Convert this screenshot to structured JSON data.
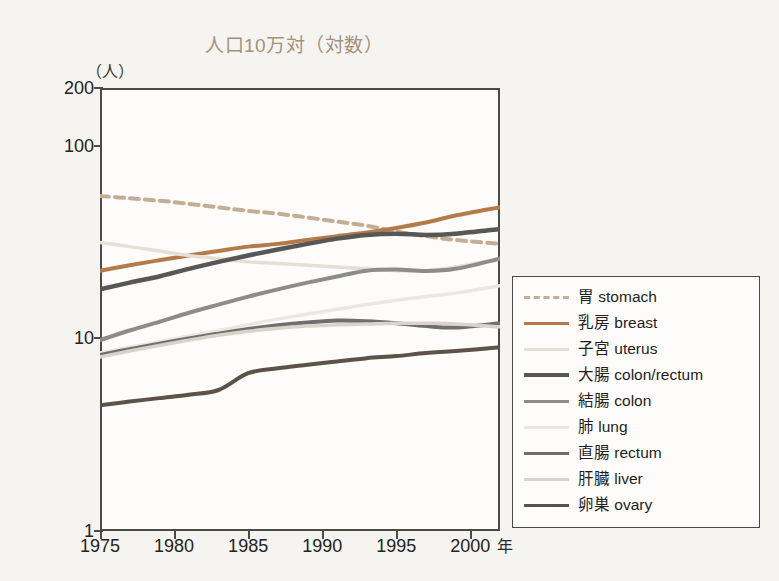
{
  "chart_data": {
    "type": "line",
    "title": "人口10万対（対数）",
    "ylabel": "（人）",
    "xlabel": "年",
    "yscale": "log",
    "ylim": [
      1,
      200
    ],
    "xlim": [
      1975,
      2002
    ],
    "yticks": [
      "200",
      "100",
      "10",
      "1"
    ],
    "ytick_values": [
      200,
      100,
      10,
      1
    ],
    "xticks": [
      "1975",
      "1980",
      "1985",
      "1990",
      "1995",
      "2000"
    ],
    "xtick_values": [
      1975,
      1980,
      1985,
      1990,
      1995,
      2000
    ],
    "grid": false,
    "legend_position": "right",
    "x": [
      1975,
      1977,
      1979,
      1981,
      1983,
      1985,
      1987,
      1989,
      1991,
      1993,
      1995,
      1997,
      1999,
      2002
    ],
    "series": [
      {
        "name": "胃 stomach",
        "color": "#c3ae93",
        "style": "dashed",
        "width": 4.0,
        "values": [
          55.0,
          53.5,
          52.0,
          50.0,
          48.0,
          46.0,
          44.5,
          42.5,
          40.5,
          38.5,
          36.0,
          34.0,
          32.5,
          31.0
        ]
      },
      {
        "name": "乳房 breast",
        "color": "#b57a4a",
        "style": "solid",
        "width": 4.0,
        "values": [
          22.5,
          24.0,
          25.5,
          27.0,
          28.5,
          30.0,
          31.0,
          32.5,
          34.0,
          35.5,
          37.5,
          40.0,
          43.5,
          48.0
        ]
      },
      {
        "name": "子宮 uterus",
        "color": "#e4e0d7",
        "style": "solid",
        "width": 3.5,
        "values": [
          31.5,
          30.0,
          28.5,
          27.0,
          26.0,
          25.0,
          24.5,
          24.0,
          23.5,
          23.0,
          22.5,
          22.5,
          23.5,
          26.0
        ]
      },
      {
        "name": "大腸 colon/rectum",
        "color": "#575757",
        "style": "solid",
        "width": 4.5,
        "values": [
          18.0,
          19.5,
          21.0,
          23.0,
          25.0,
          27.0,
          29.0,
          31.0,
          33.0,
          34.5,
          35.0,
          34.5,
          35.0,
          37.0
        ]
      },
      {
        "name": "結腸 colon",
        "color": "#8c8c8c",
        "style": "solid",
        "width": 4.0,
        "values": [
          9.8,
          11.0,
          12.2,
          13.6,
          15.0,
          16.5,
          18.0,
          19.5,
          21.0,
          22.5,
          22.8,
          22.4,
          23.0,
          26.0
        ]
      },
      {
        "name": "肺 lung",
        "color": "#ebe8e3",
        "style": "solid",
        "width": 3.5,
        "values": [
          8.4,
          9.0,
          9.6,
          10.3,
          11.0,
          11.8,
          12.6,
          13.4,
          14.2,
          15.0,
          15.8,
          16.5,
          17.2,
          18.8
        ]
      },
      {
        "name": "直腸 rectum",
        "color": "#6f6f6f",
        "style": "solid",
        "width": 4.0,
        "values": [
          8.2,
          8.8,
          9.4,
          10.0,
          10.6,
          11.2,
          11.7,
          12.1,
          12.4,
          12.3,
          12.0,
          11.6,
          11.4,
          12.0
        ]
      },
      {
        "name": "肝臓 liver",
        "color": "#d8d4cd",
        "style": "solid",
        "width": 3.5,
        "values": [
          8.0,
          8.6,
          9.2,
          9.8,
          10.4,
          10.9,
          11.3,
          11.6,
          11.8,
          11.9,
          12.0,
          12.0,
          11.9,
          11.5
        ]
      },
      {
        "name": "卵巣 ovary",
        "color": "#5b5248",
        "style": "solid",
        "width": 4.0,
        "values": [
          4.5,
          4.7,
          4.9,
          5.1,
          5.4,
          6.6,
          7.0,
          7.3,
          7.6,
          7.9,
          8.1,
          8.4,
          8.6,
          9.0
        ]
      }
    ]
  }
}
